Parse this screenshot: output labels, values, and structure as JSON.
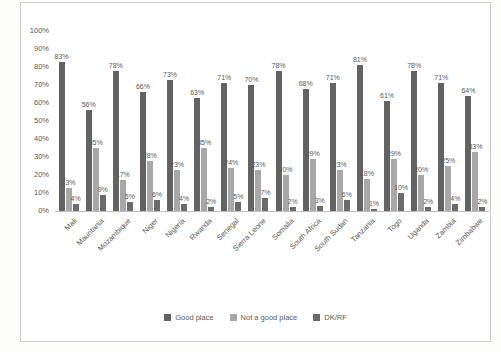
{
  "chart_data": {
    "type": "bar",
    "title": "",
    "categories": [
      "Mali",
      "Mauritania",
      "Mozambique",
      "Niger",
      "Nigeria",
      "Rwanda",
      "Senegal",
      "Sierra Leone",
      "Somalia",
      "South Africa",
      "South Sudan",
      "Tanzania",
      "Togo",
      "Uganda",
      "Zambia",
      "Zimbabwe"
    ],
    "series": [
      {
        "name": "Good place",
        "color": "#636363",
        "values": [
          83,
          56,
          78,
          66,
          73,
          63,
          71,
          70,
          78,
          68,
          71,
          81,
          61,
          78,
          71,
          64
        ]
      },
      {
        "name": "Not a good place",
        "color": "#a8a8a8",
        "values": [
          13,
          35,
          17,
          28,
          23,
          35,
          24,
          23,
          20,
          29,
          23,
          18,
          29,
          20,
          25,
          33
        ]
      },
      {
        "name": "DK/RF",
        "color": "#6b6b6b",
        "values": [
          4,
          9,
          5,
          6,
          4,
          2,
          5,
          7,
          2,
          3,
          6,
          1,
          10,
          2,
          4,
          2
        ]
      }
    ],
    "value_label_suffix": "%",
    "y_axis": {
      "min": 0,
      "max": 100,
      "step": 10,
      "tick_suffix": "%",
      "ticks": [
        "0%",
        "10%",
        "20%",
        "30%",
        "40%",
        "50%",
        "60%",
        "70%",
        "80%",
        "90%",
        "100%"
      ]
    },
    "xlabel": "",
    "ylabel": "",
    "grid": false,
    "legend_position": "bottom"
  }
}
